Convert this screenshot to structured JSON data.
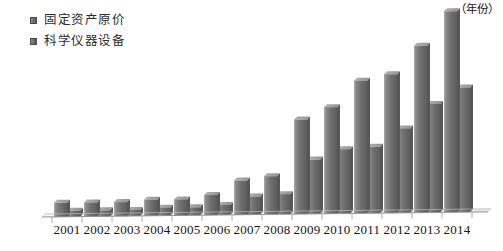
{
  "legend": {
    "position": "top-left",
    "items": [
      {
        "label": "固定资产原价",
        "swatch": "legend-swatch-icon",
        "color": "#6f6f6f"
      },
      {
        "label": "科学仪器设备",
        "swatch": "legend-swatch-icon",
        "color": "#6f6f6f"
      }
    ]
  },
  "axis": {
    "unit_label": "（年份）",
    "baseline_color": "#9a9a9a"
  },
  "chart_data": {
    "type": "bar",
    "title": "",
    "subtitle": "",
    "xlabel": "（年份）",
    "ylabel": "",
    "grid": false,
    "legend_position": "top-left",
    "categories": [
      "2001",
      "2002",
      "2003",
      "2004",
      "2005",
      "2006",
      "2007",
      "2008",
      "2009",
      "2010",
      "2011",
      "2012",
      "2013",
      "2014"
    ],
    "ylim": [
      0,
      100
    ],
    "series": [
      {
        "name": "固定资产原价",
        "color": "#6f6f6f",
        "values": [
          7,
          7,
          7,
          8,
          8,
          10,
          17,
          19,
          47,
          53,
          66,
          69,
          83,
          100
        ]
      },
      {
        "name": "科学仪器设备",
        "color": "#6f6f6f",
        "values": [
          3,
          3,
          3,
          4,
          4,
          5,
          9,
          10,
          27,
          32,
          33,
          42,
          54,
          62
        ]
      }
    ]
  }
}
